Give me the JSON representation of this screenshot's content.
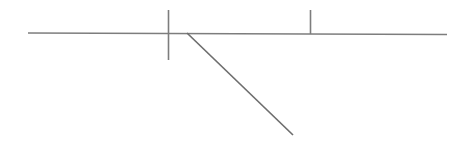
{
  "canvas": {
    "width": 469,
    "height": 142,
    "background_color": "#ffffff",
    "title": "Line Drawing"
  },
  "style": {
    "stroke_color": "#7d7d7d",
    "stroke_color_dark": "#6e6e6e",
    "stroke_width_baseline": 1.5,
    "stroke_width_tick": 1.6,
    "stroke_width_diagonal": 1.7
  },
  "chart_data": {
    "type": "line",
    "title": "",
    "xlabel": "",
    "ylabel": "",
    "grid": false,
    "legend": null,
    "xlim": [
      0,
      469
    ],
    "ylim": [
      142,
      0
    ],
    "series": [
      {
        "name": "baseline",
        "kind": "segment",
        "x": [
          28,
          447
        ],
        "y": [
          33,
          34.5
        ]
      },
      {
        "name": "tick-crossing",
        "kind": "segment",
        "x": [
          168.5,
          168.5
        ],
        "y": [
          10,
          60
        ]
      },
      {
        "name": "tick-upper",
        "kind": "segment",
        "x": [
          310.5,
          310.5
        ],
        "y": [
          10,
          34
        ]
      },
      {
        "name": "diagonal",
        "kind": "segment",
        "x": [
          187,
          293
        ],
        "y": [
          33,
          135
        ]
      }
    ]
  },
  "geometry": {
    "baseline": {
      "label": "horizontal-baseline",
      "x1": 28,
      "y1": 33,
      "x2": 447,
      "y2": 34.5
    },
    "tick_crossing": {
      "label": "vertical-tick-crossing",
      "x1": 168.5,
      "y1": 10,
      "x2": 168.5,
      "y2": 60
    },
    "tick_upper": {
      "label": "vertical-tick-upper",
      "x1": 310.5,
      "y1": 10,
      "x2": 310.5,
      "y2": 34
    },
    "diagonal": {
      "label": "diagonal-descender",
      "x1": 187,
      "y1": 33,
      "x2": 293,
      "y2": 135
    }
  }
}
